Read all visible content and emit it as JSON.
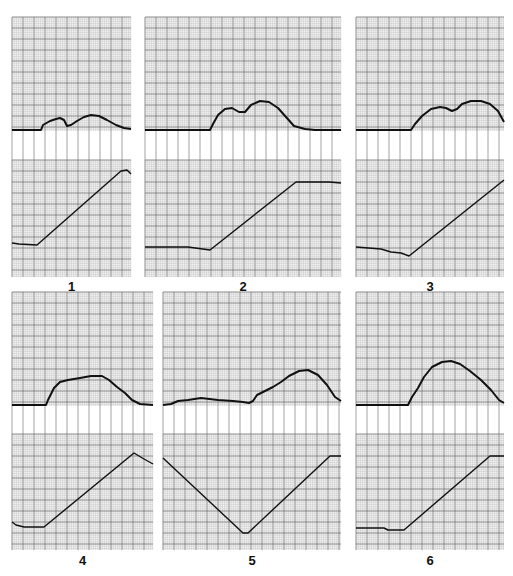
{
  "chart_data": [
    {
      "id": "1",
      "label": "1",
      "type": "line",
      "box": {
        "x": 12,
        "y": 17,
        "w": 119,
        "top_h": 114,
        "strip_h": 29,
        "bottom_h": 117
      },
      "top_series": [
        [
          0,
          0
        ],
        [
          29,
          0
        ],
        [
          31,
          -5
        ],
        [
          38,
          -9
        ],
        [
          44,
          -11
        ],
        [
          48,
          -12
        ],
        [
          52,
          -10
        ],
        [
          55,
          -4
        ],
        [
          59,
          -5
        ],
        [
          65,
          -9
        ],
        [
          72,
          -13
        ],
        [
          79,
          -15
        ],
        [
          87,
          -14
        ],
        [
          95,
          -10
        ],
        [
          104,
          -5
        ],
        [
          112,
          -2
        ],
        [
          119,
          -1
        ]
      ],
      "bottom_series": [
        [
          0,
          83
        ],
        [
          7,
          84
        ],
        [
          25,
          85
        ],
        [
          119,
          14
        ],
        [
          115,
          16
        ],
        [
          109,
          11
        ],
        [
          119,
          14
        ]
      ],
      "label_y": 287
    },
    {
      "id": "2",
      "label": "2",
      "type": "line",
      "box": {
        "x": 145,
        "y": 17,
        "w": 196,
        "top_h": 114,
        "strip_h": 29,
        "bottom_h": 117
      },
      "top_series": [
        [
          0,
          0
        ],
        [
          65,
          0
        ],
        [
          68,
          -6
        ],
        [
          73,
          -15
        ],
        [
          80,
          -21
        ],
        [
          87,
          -22
        ],
        [
          94,
          -18
        ],
        [
          100,
          -18
        ],
        [
          106,
          -25
        ],
        [
          115,
          -29
        ],
        [
          124,
          -28
        ],
        [
          133,
          -22
        ],
        [
          141,
          -13
        ],
        [
          149,
          -4
        ],
        [
          160,
          -1
        ],
        [
          170,
          0
        ],
        [
          196,
          0
        ]
      ],
      "bottom_series": [
        [
          0,
          87
        ],
        [
          43,
          87
        ],
        [
          65,
          90
        ],
        [
          151,
          22
        ],
        [
          184,
          22
        ],
        [
          196,
          23
        ]
      ],
      "label_y": 287
    },
    {
      "id": "3",
      "label": "3",
      "type": "line",
      "box": {
        "x": 356,
        "y": 17,
        "w": 148,
        "top_h": 114,
        "strip_h": 29,
        "bottom_h": 117
      },
      "top_series": [
        [
          0,
          0
        ],
        [
          55,
          0
        ],
        [
          59,
          -6
        ],
        [
          66,
          -14
        ],
        [
          75,
          -21
        ],
        [
          84,
          -23
        ],
        [
          90,
          -22
        ],
        [
          96,
          -19
        ],
        [
          101,
          -21
        ],
        [
          106,
          -26
        ],
        [
          115,
          -29
        ],
        [
          125,
          -29
        ],
        [
          134,
          -26
        ],
        [
          142,
          -19
        ],
        [
          148,
          -8
        ]
      ],
      "bottom_series": [
        [
          0,
          87
        ],
        [
          25,
          89
        ],
        [
          35,
          92
        ],
        [
          45,
          93
        ],
        [
          53,
          96
        ],
        [
          148,
          20
        ]
      ],
      "label_y": 287
    },
    {
      "id": "4",
      "label": "4",
      "type": "line",
      "box": {
        "x": 12,
        "y": 292,
        "w": 141,
        "top_h": 114,
        "strip_h": 28,
        "bottom_h": 116
      },
      "top_series": [
        [
          0,
          0
        ],
        [
          34,
          0
        ],
        [
          36,
          -5
        ],
        [
          42,
          -17
        ],
        [
          48,
          -23
        ],
        [
          56,
          -25
        ],
        [
          68,
          -27
        ],
        [
          79,
          -29
        ],
        [
          90,
          -29
        ],
        [
          97,
          -25
        ],
        [
          105,
          -18
        ],
        [
          113,
          -12
        ],
        [
          120,
          -5
        ],
        [
          128,
          -1
        ],
        [
          141,
          0
        ]
      ],
      "bottom_series": [
        [
          0,
          88
        ],
        [
          4,
          91
        ],
        [
          12,
          93
        ],
        [
          32,
          93
        ],
        [
          122,
          19
        ],
        [
          132,
          25
        ],
        [
          141,
          30
        ]
      ],
      "label_y": 561
    },
    {
      "id": "5",
      "label": "5",
      "type": "line",
      "box": {
        "x": 163,
        "y": 292,
        "w": 178,
        "top_h": 114,
        "strip_h": 28,
        "bottom_h": 116
      },
      "top_series": [
        [
          0,
          0
        ],
        [
          8,
          -1
        ],
        [
          15,
          -4
        ],
        [
          25,
          -5
        ],
        [
          38,
          -7
        ],
        [
          55,
          -5
        ],
        [
          70,
          -4
        ],
        [
          80,
          -3
        ],
        [
          86,
          -2
        ],
        [
          90,
          -4
        ],
        [
          94,
          -10
        ],
        [
          102,
          -14
        ],
        [
          110,
          -18
        ],
        [
          118,
          -23
        ],
        [
          126,
          -29
        ],
        [
          136,
          -34
        ],
        [
          145,
          -35
        ],
        [
          155,
          -30
        ],
        [
          164,
          -20
        ],
        [
          172,
          -8
        ],
        [
          178,
          -4
        ]
      ],
      "bottom_series": [
        [
          0,
          24
        ],
        [
          80,
          99
        ],
        [
          85,
          99
        ],
        [
          167,
          22
        ],
        [
          178,
          22
        ]
      ],
      "label_y": 561
    },
    {
      "id": "6",
      "label": "6",
      "type": "line",
      "box": {
        "x": 356,
        "y": 292,
        "w": 148,
        "top_h": 114,
        "strip_h": 28,
        "bottom_h": 116
      },
      "top_series": [
        [
          0,
          0
        ],
        [
          52,
          0
        ],
        [
          56,
          -8
        ],
        [
          62,
          -17
        ],
        [
          68,
          -28
        ],
        [
          76,
          -38
        ],
        [
          86,
          -43
        ],
        [
          95,
          -44
        ],
        [
          104,
          -41
        ],
        [
          114,
          -34
        ],
        [
          125,
          -25
        ],
        [
          135,
          -15
        ],
        [
          143,
          -5
        ],
        [
          148,
          -2
        ]
      ],
      "bottom_series": [
        [
          0,
          94
        ],
        [
          28,
          94
        ],
        [
          32,
          96
        ],
        [
          48,
          96
        ],
        [
          134,
          22
        ],
        [
          148,
          22
        ]
      ],
      "label_y": 561
    }
  ],
  "style": {
    "grid_minor": "#bcbcbc",
    "grid_major": "#6e6e6e",
    "grid_bg": "#f4f4f4",
    "curve_color": "#111111",
    "strip_line": "#9a9a9a"
  }
}
